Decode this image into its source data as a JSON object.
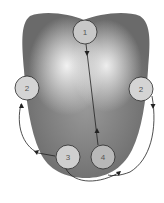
{
  "diagram": {
    "points": [
      {
        "id": "p1",
        "label": "1",
        "cx": 85,
        "cy": 32
      },
      {
        "id": "p2-left",
        "label": "2",
        "cx": 27,
        "cy": 88
      },
      {
        "id": "p2-right",
        "label": "2",
        "cx": 141,
        "cy": 89
      },
      {
        "id": "p3",
        "label": "3",
        "cx": 68,
        "cy": 157
      },
      {
        "id": "p4",
        "label": "4",
        "cx": 103,
        "cy": 157
      }
    ],
    "colors": {
      "tongue_dark": "#6e6e6e",
      "tongue_light": "#e2e2e2",
      "circle_fill": "#c8c8c8",
      "stroke": "#2a2a2a"
    }
  }
}
